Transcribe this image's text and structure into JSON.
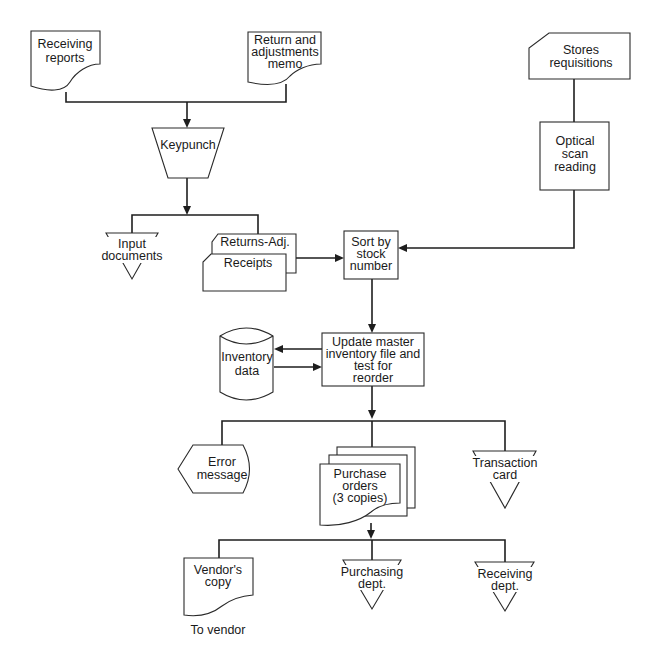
{
  "diagram": {
    "type": "system-flowchart",
    "colors": {
      "stroke": "#2a2a2a",
      "background": "#ffffff",
      "text": "#1a1a1a"
    },
    "nodes": {
      "receiving_reports": {
        "shape": "document",
        "lines": [
          "Receiving",
          "reports"
        ]
      },
      "return_memo": {
        "shape": "document",
        "lines": [
          "Return and",
          "adjustments",
          "memo"
        ]
      },
      "stores_requisitions": {
        "shape": "punched-card",
        "lines": [
          "Stores",
          "requisitions"
        ]
      },
      "keypunch": {
        "shape": "manual-operation",
        "lines": [
          "Keypunch"
        ]
      },
      "optical_scan": {
        "shape": "process",
        "lines": [
          "Optical",
          "scan",
          "reading"
        ]
      },
      "input_documents": {
        "shape": "offline-storage",
        "lines": [
          "Input",
          "documents"
        ]
      },
      "returns_adj_card": {
        "shape": "punched-card",
        "lines": [
          "Returns-Adj."
        ]
      },
      "receipts_card": {
        "shape": "punched-card",
        "lines": [
          "Receipts"
        ]
      },
      "sort": {
        "shape": "process",
        "lines": [
          "Sort by",
          "stock",
          "number"
        ]
      },
      "inventory_data": {
        "shape": "magnetic-disk",
        "lines": [
          "Inventory",
          "data"
        ]
      },
      "update_master": {
        "shape": "process",
        "lines": [
          "Update master",
          "inventory file and",
          "test for",
          "reorder"
        ]
      },
      "error_message": {
        "shape": "display",
        "lines": [
          "Error",
          "message"
        ]
      },
      "purchase_orders": {
        "shape": "multi-document",
        "lines": [
          "Purchase",
          "orders",
          "(3 copies)"
        ]
      },
      "transaction_card": {
        "shape": "offline-storage",
        "lines": [
          "Transaction",
          "card"
        ]
      },
      "vendors_copy": {
        "shape": "document",
        "lines": [
          "Vendor's",
          "copy"
        ]
      },
      "purchasing_dept": {
        "shape": "offline-storage",
        "lines": [
          "Purchasing",
          "dept."
        ]
      },
      "receiving_dept": {
        "shape": "offline-storage",
        "lines": [
          "Receiving",
          "dept."
        ]
      }
    },
    "annotations": {
      "to_vendor": "To vendor"
    },
    "edges": [
      [
        "receiving_reports",
        "keypunch"
      ],
      [
        "return_memo",
        "keypunch"
      ],
      [
        "keypunch",
        "input_documents"
      ],
      [
        "keypunch",
        "returns_adj_card"
      ],
      [
        "returns_adj_card",
        "sort"
      ],
      [
        "stores_requisitions",
        "optical_scan"
      ],
      [
        "optical_scan",
        "sort"
      ],
      [
        "sort",
        "update_master"
      ],
      [
        "update_master",
        "inventory_data"
      ],
      [
        "inventory_data",
        "update_master"
      ],
      [
        "update_master",
        "error_message"
      ],
      [
        "update_master",
        "purchase_orders"
      ],
      [
        "update_master",
        "transaction_card"
      ],
      [
        "purchase_orders",
        "vendors_copy"
      ],
      [
        "purchase_orders",
        "purchasing_dept"
      ],
      [
        "purchase_orders",
        "receiving_dept"
      ]
    ]
  }
}
